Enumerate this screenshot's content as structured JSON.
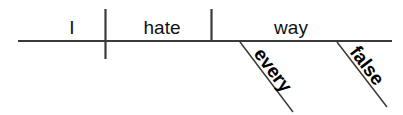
{
  "diagram": {
    "type": "reed-kellogg-sentence-diagram",
    "sentence": "I hate every false way",
    "canvas": {
      "width": 403,
      "height": 115,
      "background": "#ffffff"
    },
    "stroke_color": "#3a3a3a",
    "text_color": "#111111",
    "baseline": {
      "name": "main-baseline",
      "x1": 18,
      "y1": 41,
      "x2": 392,
      "y2": 41,
      "stroke_width": 2.2
    },
    "dividers": [
      {
        "name": "subject-verb-divider",
        "role": "subject | predicate",
        "x": 105.5,
        "y1": 9,
        "y2": 59,
        "stroke_width": 2.2
      },
      {
        "name": "verb-object-divider",
        "role": "verb | direct object",
        "x": 211.5,
        "y1": 9,
        "y2": 41,
        "stroke_width": 2.2
      }
    ],
    "words": [
      {
        "id": "subject",
        "text": "I",
        "role": "subject",
        "x": 72,
        "y": 34,
        "anchor": "middle",
        "weight": 400
      },
      {
        "id": "verb",
        "text": "hate",
        "role": "verb",
        "x": 162,
        "y": 34,
        "anchor": "middle",
        "weight": 400
      },
      {
        "id": "object",
        "text": "way",
        "role": "direct object",
        "x": 291,
        "y": 34,
        "anchor": "middle",
        "weight": 400
      }
    ],
    "modifiers": [
      {
        "id": "modifier-every",
        "text": "every",
        "role": "determiner modifying 'way'",
        "line": {
          "x1": 240,
          "y1": 42,
          "x2": 293,
          "y2": 112,
          "stroke_width": 1.5
        },
        "label": {
          "x": 253,
          "y": 54,
          "rotation": 53
        }
      },
      {
        "id": "modifier-false",
        "text": "false",
        "role": "adjective modifying 'way'",
        "line": {
          "x1": 337,
          "y1": 42,
          "x2": 387,
          "y2": 107,
          "stroke_width": 1.5
        },
        "label": {
          "x": 349,
          "y": 52,
          "rotation": 53
        }
      }
    ]
  }
}
